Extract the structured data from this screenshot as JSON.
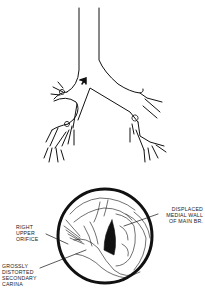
{
  "diagram": {
    "upper": {
      "name": "bronchial tree schematic",
      "arrow_marker": "arrow-pointing-down-left at carina"
    },
    "lower": {
      "name": "bronchoscopic view",
      "labels": {
        "right_upper_orifice": [
          "RIGHT",
          "UPPER",
          "ORIFICE"
        ],
        "grossly_distorted_secondary_carina": [
          "GROSSLY",
          "DISTORTED",
          "SECONDARY",
          "CARINA"
        ],
        "displaced_medial_wall": [
          "DISPLACED",
          "MEDIAL WALL",
          "OF MAIN BR."
        ]
      }
    },
    "colors": {
      "ink": "#111111",
      "background": "#ffffff"
    }
  }
}
